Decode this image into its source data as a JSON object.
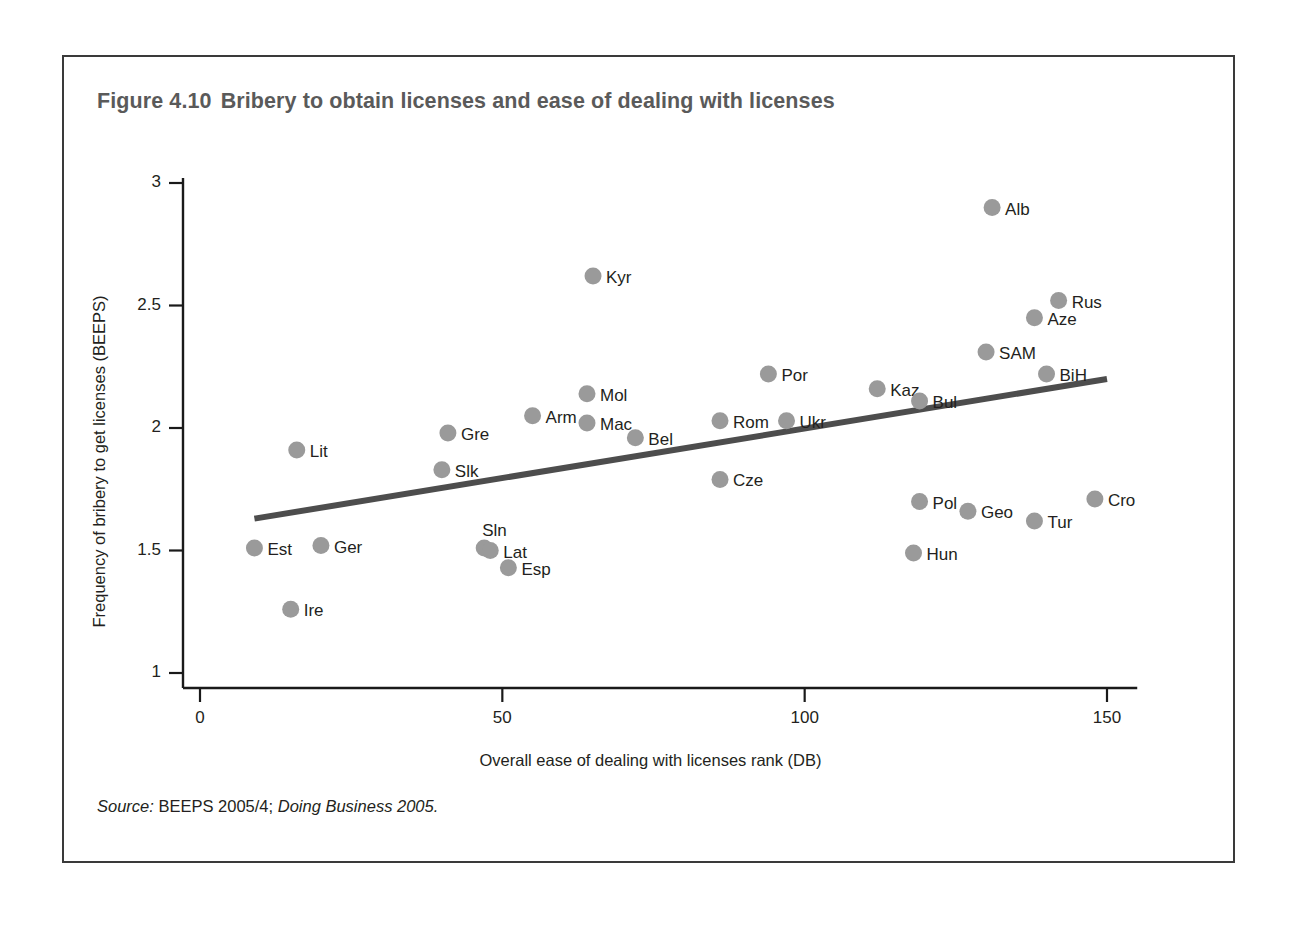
{
  "figure": {
    "number": "Figure 4.10",
    "title": "Bribery to obtain licenses and ease of dealing with licenses",
    "source_label": "Source:",
    "source_text": "BEEPS 2005/4;",
    "source_italic": "Doing Business 2005."
  },
  "chart_data": {
    "type": "scatter",
    "title": "Bribery to obtain licenses and ease of dealing with licenses",
    "xlabel": "Overall ease of dealing with licenses rank (DB)",
    "ylabel": "Frequency of bribery to get licenses (BEEPS)",
    "xlim": [
      0,
      155
    ],
    "ylim": [
      1,
      3
    ],
    "xticks": [
      0,
      50,
      100,
      150
    ],
    "xtick_labels": [
      "0",
      "50",
      "100",
      "150"
    ],
    "yticks": [
      1,
      1.5,
      2,
      2.5,
      3
    ],
    "ytick_labels": [
      "1",
      "1.5",
      "2",
      "2.5",
      "3"
    ],
    "grid": false,
    "legend": false,
    "point_color": "#9a9a9a",
    "trendline_color": "#4d4d4d",
    "trendline": {
      "x": [
        9,
        150
      ],
      "y": [
        1.63,
        2.2
      ]
    },
    "points": [
      {
        "label": "Est",
        "x": 9,
        "y": 1.51,
        "label_pos": "right"
      },
      {
        "label": "Ire",
        "x": 15,
        "y": 1.26,
        "label_pos": "right"
      },
      {
        "label": "Lit",
        "x": 16,
        "y": 1.91,
        "label_pos": "right"
      },
      {
        "label": "Ger",
        "x": 20,
        "y": 1.52,
        "label_pos": "right"
      },
      {
        "label": "Gre",
        "x": 41,
        "y": 1.98,
        "label_pos": "right"
      },
      {
        "label": "Slk",
        "x": 40,
        "y": 1.83,
        "label_pos": "right"
      },
      {
        "label": "Sln",
        "x": 47,
        "y": 1.51,
        "label_pos": "above"
      },
      {
        "label": "Lat",
        "x": 48,
        "y": 1.5,
        "label_pos": "right"
      },
      {
        "label": "Esp",
        "x": 51,
        "y": 1.43,
        "label_pos": "right"
      },
      {
        "label": "Arm",
        "x": 55,
        "y": 2.05,
        "label_pos": "right"
      },
      {
        "label": "Mol",
        "x": 64,
        "y": 2.14,
        "label_pos": "right"
      },
      {
        "label": "Kyr",
        "x": 65,
        "y": 2.62,
        "label_pos": "right"
      },
      {
        "label": "Mac",
        "x": 64,
        "y": 2.02,
        "label_pos": "right"
      },
      {
        "label": "Bel",
        "x": 72,
        "y": 1.96,
        "label_pos": "right"
      },
      {
        "label": "Cze",
        "x": 86,
        "y": 1.79,
        "label_pos": "right"
      },
      {
        "label": "Rom",
        "x": 86,
        "y": 2.03,
        "label_pos": "right"
      },
      {
        "label": "Por",
        "x": 94,
        "y": 2.22,
        "label_pos": "right"
      },
      {
        "label": "Ukr",
        "x": 97,
        "y": 2.03,
        "label_pos": "right"
      },
      {
        "label": "Kaz",
        "x": 112,
        "y": 2.16,
        "label_pos": "right"
      },
      {
        "label": "Bul",
        "x": 119,
        "y": 2.11,
        "label_pos": "right"
      },
      {
        "label": "Hun",
        "x": 118,
        "y": 1.49,
        "label_pos": "right"
      },
      {
        "label": "Pol",
        "x": 119,
        "y": 1.7,
        "label_pos": "right"
      },
      {
        "label": "Geo",
        "x": 127,
        "y": 1.66,
        "label_pos": "right"
      },
      {
        "label": "SAM",
        "x": 130,
        "y": 2.31,
        "label_pos": "right"
      },
      {
        "label": "Alb",
        "x": 131,
        "y": 2.9,
        "label_pos": "right"
      },
      {
        "label": "Tur",
        "x": 138,
        "y": 1.62,
        "label_pos": "right"
      },
      {
        "label": "Aze",
        "x": 138,
        "y": 2.45,
        "label_pos": "right"
      },
      {
        "label": "BiH",
        "x": 140,
        "y": 2.22,
        "label_pos": "right"
      },
      {
        "label": "Rus",
        "x": 142,
        "y": 2.52,
        "label_pos": "right"
      },
      {
        "label": "Cro",
        "x": 148,
        "y": 1.71,
        "label_pos": "right"
      }
    ]
  }
}
